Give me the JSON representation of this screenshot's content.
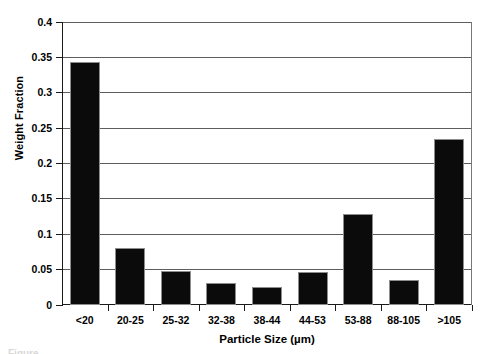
{
  "chart_data": {
    "type": "bar",
    "title": "",
    "subtitle": "",
    "xlabel": "Particle Size (µm)",
    "ylabel": "Weight Fraction",
    "categories": [
      "<20",
      "20-25",
      "25-32",
      "32-38",
      "38-44",
      "44-53",
      "53-88",
      "88-105",
      ">105"
    ],
    "values": [
      0.344,
      0.081,
      0.048,
      0.031,
      0.026,
      0.046,
      0.128,
      0.036,
      0.235
    ],
    "series": [
      {
        "name": "Weight Fraction",
        "values": [
          0.344,
          0.081,
          0.048,
          0.031,
          0.026,
          0.046,
          0.128,
          0.036,
          0.235
        ]
      }
    ],
    "ylim": [
      0,
      0.4
    ],
    "ytick_step": 0.05,
    "ytick_labels": [
      "0",
      "0.05",
      "0.1",
      "0.15",
      "0.2",
      "0.25",
      "0.3",
      "0.35",
      "0.4"
    ],
    "ytick_values": [
      0,
      0.05,
      0.1,
      0.15,
      0.2,
      0.25,
      0.3,
      0.35,
      0.4
    ],
    "grid": "horizontal",
    "legend": "none",
    "bar_color": "#0b0b0b",
    "bar_outline_color": "#8d8d8d",
    "gridline_color": "#5d5d5d",
    "axis_color": "#1a1a1a",
    "background_color": "#ffffff"
  },
  "caption_sliver": "Figure"
}
